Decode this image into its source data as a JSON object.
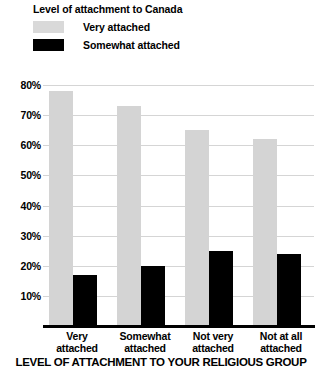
{
  "legend": {
    "title": "Level of attachment to Canada",
    "items": [
      {
        "label": "Very attached",
        "color": "#d4d4d4",
        "swatch": "very"
      },
      {
        "label": "Somewhat attached",
        "color": "#000000",
        "swatch": "somewhat"
      }
    ]
  },
  "chart_data": {
    "type": "bar",
    "title": "Level of attachment to Canada",
    "xlabel": "LEVEL OF ATTACHMENT TO YOUR RELIGIOUS GROUP",
    "ylabel": "",
    "categories": [
      "Very attached",
      "Somewhat attached",
      "Not very attached",
      "Not at all attached"
    ],
    "category_lines": [
      [
        "Very",
        "attached"
      ],
      [
        "Somewhat",
        "attached"
      ],
      [
        "Not very",
        "attached"
      ],
      [
        "Not at all",
        "attached"
      ]
    ],
    "series": [
      {
        "name": "Very attached",
        "color": "#d4d4d4",
        "values": [
          78,
          73,
          65,
          62
        ]
      },
      {
        "name": "Somewhat attached",
        "color": "#000000",
        "values": [
          17,
          20,
          25,
          24
        ]
      }
    ],
    "ylim": [
      0,
      84
    ],
    "yticks": [
      10,
      20,
      30,
      40,
      50,
      60,
      70,
      80
    ],
    "ytick_labels": [
      "10%",
      "20%",
      "30%",
      "40%",
      "50%",
      "60%",
      "70%",
      "80%"
    ],
    "grid": true,
    "legend_position": "top-left"
  },
  "axis_title": "LEVEL OF ATTACHMENT TO YOUR RELIGIOUS GROUP"
}
